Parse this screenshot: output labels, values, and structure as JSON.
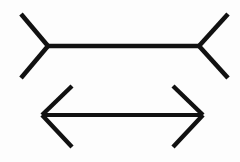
{
  "figure": {
    "title": "Müller-Lyer Illusion",
    "background_color": "#fdfdfd",
    "line_color": "#111111",
    "canvas": {
      "width": 240,
      "height": 162
    },
    "top_figure": {
      "name": "outward-fins-arrow",
      "description": "Horizontal line with outward pointing fins at both ends",
      "shaft": {
        "x1": 48,
        "y1": 46,
        "x2": 199,
        "y2": 46,
        "length": 151
      },
      "left_end": {
        "vertex_x": 48,
        "vertex_y": 46,
        "upper_fin": {
          "x1": 48,
          "y1": 46,
          "x2": 21,
          "y2": 14
        },
        "lower_fin": {
          "x1": 48,
          "y1": 46,
          "x2": 21,
          "y2": 78
        }
      },
      "right_end": {
        "vertex_x": 199,
        "vertex_y": 46,
        "upper_fin": {
          "x1": 199,
          "y1": 46,
          "x2": 228,
          "y2": 14
        },
        "lower_fin": {
          "x1": 199,
          "y1": 46,
          "x2": 228,
          "y2": 78
        }
      }
    },
    "bottom_figure": {
      "name": "inward-fins-arrow",
      "description": "Horizontal line with inward pointing arrowheads at both ends",
      "shaft": {
        "x1": 42,
        "y1": 115,
        "x2": 203,
        "y2": 115,
        "length": 161
      },
      "left_end": {
        "vertex_x": 42,
        "vertex_y": 115,
        "upper_fin": {
          "x1": 42,
          "y1": 115,
          "x2": 72,
          "y2": 86
        },
        "lower_fin": {
          "x1": 42,
          "y1": 115,
          "x2": 72,
          "y2": 147
        }
      },
      "right_end": {
        "vertex_x": 203,
        "vertex_y": 115,
        "upper_fin": {
          "x1": 203,
          "y1": 115,
          "x2": 173,
          "y2": 86
        },
        "lower_fin": {
          "x1": 203,
          "y1": 115,
          "x2": 173,
          "y2": 147
        }
      }
    }
  }
}
